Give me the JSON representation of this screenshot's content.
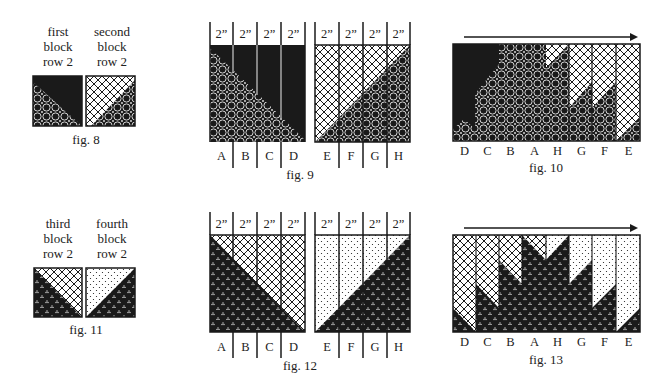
{
  "figures": {
    "fig8": {
      "caption": "fig. 8",
      "blocks": [
        {
          "label": [
            "first",
            "block",
            "row 2"
          ]
        },
        {
          "label": [
            "second",
            "block",
            "row 2"
          ]
        }
      ]
    },
    "fig9": {
      "caption": "fig. 9",
      "widths": [
        "2”",
        "2”",
        "2”",
        "2”",
        "2”",
        "2”",
        "2”",
        "2”"
      ],
      "strips": [
        "A",
        "B",
        "C",
        "D",
        "E",
        "F",
        "G",
        "H"
      ]
    },
    "fig10": {
      "caption": "fig. 10",
      "order": [
        "D",
        "C",
        "B",
        "A",
        "H",
        "G",
        "F",
        "E"
      ]
    },
    "fig11": {
      "caption": "fig. 11",
      "blocks": [
        {
          "label": [
            "third",
            "block",
            "row 2"
          ]
        },
        {
          "label": [
            "fourth",
            "block",
            "row 2"
          ]
        }
      ]
    },
    "fig12": {
      "caption": "fig. 12",
      "widths": [
        "2”",
        "2”",
        "2”",
        "2”",
        "2”",
        "2”",
        "2”",
        "2”"
      ],
      "strips": [
        "A",
        "B",
        "C",
        "D",
        "E",
        "F",
        "G",
        "H"
      ]
    },
    "fig13": {
      "caption": "fig. 13",
      "order": [
        "D",
        "C",
        "B",
        "A",
        "H",
        "G",
        "F",
        "E"
      ]
    }
  },
  "colors": {
    "ink": "#1a1a1a",
    "paper": "#ffffff"
  }
}
